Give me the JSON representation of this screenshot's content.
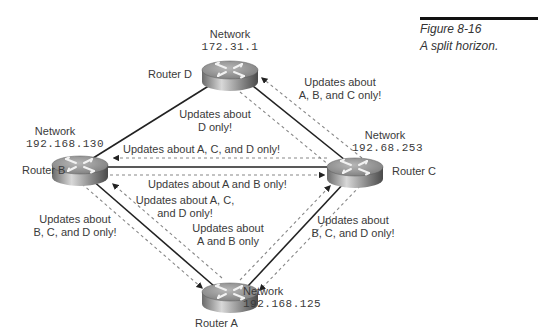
{
  "figure": {
    "number": "Figure 8-16",
    "title": "A split horizon."
  },
  "routers": {
    "D": {
      "label": "Router D",
      "network_label": "Network",
      "network": "172.31.1"
    },
    "B": {
      "label": "Router B",
      "network_label": "Network",
      "network": "192.168.130"
    },
    "C": {
      "label": "Router C",
      "network_label": "Network",
      "network": "192.68.253"
    },
    "A": {
      "label": "Router A",
      "network_label": "Network",
      "network": "192.168.125"
    }
  },
  "updates": {
    "c_to_d": [
      "Updates about",
      "A, B, and C only!"
    ],
    "d_to_c": [
      "Updates about",
      "D only!"
    ],
    "c_to_b": "Updates about A, C, and D only!",
    "b_to_c": "Updates about A and B only!",
    "a_to_b": [
      "Updates about A, C,",
      "and D only!"
    ],
    "b_to_a": [
      "Updates about",
      "B, C, and D only!"
    ],
    "a_to_c": [
      "Updates about",
      "A and B only"
    ],
    "c_to_a": [
      "Updates about",
      "B, C, and D only!"
    ]
  },
  "colors": {
    "link": "#222222",
    "update_arrow": "#888888",
    "caption_rule": "#111111"
  }
}
